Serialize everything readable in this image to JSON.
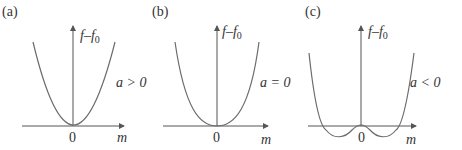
{
  "figure": {
    "panels": [
      {
        "id": "a",
        "tag": "(a)",
        "y_axis_label": "f–f",
        "y_axis_sub": "0",
        "x_axis_label": "m",
        "origin_label": "0",
        "condition": "a > 0",
        "curve": "single-well parabola, minimum at m = 0"
      },
      {
        "id": "b",
        "tag": "(b)",
        "y_axis_label": "f–f",
        "y_axis_sub": "0",
        "x_axis_label": "m",
        "origin_label": "0",
        "condition": "a = 0",
        "curve": "flat-bottomed quartic, minimum at m = 0"
      },
      {
        "id": "c",
        "tag": "(c)",
        "y_axis_label": "f–f",
        "y_axis_sub": "0",
        "x_axis_label": "m",
        "origin_label": "0",
        "condition": "a < 0",
        "curve": "double-well, two minima below zero, local max at m = 0"
      }
    ]
  }
}
